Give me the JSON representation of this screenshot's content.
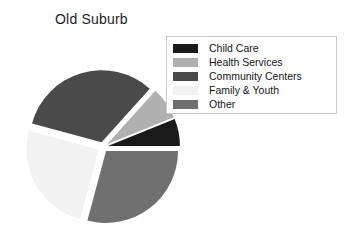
{
  "chart_data": {
    "type": "pie",
    "title": "Old Suburb",
    "exploded": true,
    "legend_position": "top-right",
    "categories": [
      "Child Care",
      "Health Services",
      "Community Centers",
      "Family & Youth",
      "Other"
    ],
    "values": [
      6,
      7,
      32,
      25,
      30
    ],
    "unit": "percent",
    "colors": [
      "#1a1a1a",
      "#b0b0b0",
      "#4a4a4a",
      "#f2f2f2",
      "#707070"
    ],
    "slices": [
      {
        "label": "Child Care",
        "value": 6,
        "color": "#1a1a1a",
        "start_angle": 338,
        "end_angle": 360
      },
      {
        "label": "Health Services",
        "value": 7,
        "color": "#b0b0b0",
        "start_angle": 312,
        "end_angle": 338
      },
      {
        "label": "Community Centers",
        "value": 32,
        "color": "#4a4a4a",
        "start_angle": 195,
        "end_angle": 312
      },
      {
        "label": "Family & Youth",
        "value": 25,
        "color": "#f2f2f2",
        "start_angle": 105,
        "end_angle": 195
      },
      {
        "label": "Other",
        "value": 30,
        "color": "#707070",
        "start_angle": 0,
        "end_angle": 105
      }
    ],
    "xlabel": "",
    "ylabel": ""
  },
  "title": {
    "text": "Old Suburb"
  },
  "legend": {
    "border_color": "#c8c8c8",
    "background": "#ffffff",
    "items": [
      {
        "label": "Child Care",
        "color": "#1a1a1a"
      },
      {
        "label": "Health Services",
        "color": "#b0b0b0"
      },
      {
        "label": "Community Centers",
        "color": "#4a4a4a"
      },
      {
        "label": "Family & Youth",
        "color": "#f2f2f2"
      },
      {
        "label": "Other",
        "color": "#707070"
      }
    ]
  },
  "pie_geometry": {
    "center_x": 103,
    "center_y": 147,
    "radius": 72,
    "explode_offset": 5
  }
}
